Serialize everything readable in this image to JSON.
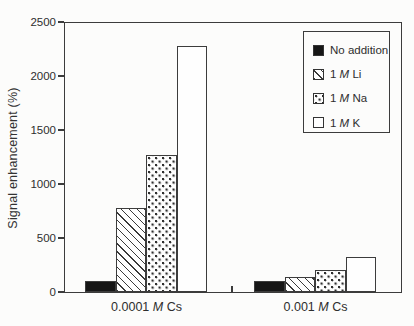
{
  "figure": {
    "background": "#fcfcfb",
    "line_color": "#3c3c3c",
    "text_color": "#2e2e2e",
    "bar_fill_black": "#161616"
  },
  "chart_data": {
    "type": "bar",
    "title": "",
    "xlabel": "",
    "ylabel": "Signal enhancement (%)",
    "ylim": [
      0,
      2500
    ],
    "yticks": [
      "0",
      "500",
      "1000",
      "1500",
      "2000",
      "2500"
    ],
    "ytick_values": [
      0,
      500,
      1000,
      1500,
      2000,
      2500
    ],
    "grid": false,
    "legend_position": "top-right",
    "categories": [
      {
        "label": "0.0001 M Cs",
        "parts": {
          "prefix": "0.0001 ",
          "italic": "M",
          "suffix": " Cs"
        }
      },
      {
        "label": "0.001 M Cs",
        "parts": {
          "prefix": "0.001 ",
          "italic": "M",
          "suffix": " Cs"
        }
      }
    ],
    "series": [
      {
        "name": "No addition",
        "parts": {
          "prefix": "No addition",
          "italic": "",
          "suffix": ""
        },
        "pattern": "solid-black",
        "values": [
          100,
          100
        ]
      },
      {
        "name": "1 M Li",
        "parts": {
          "prefix": "1 ",
          "italic": "M",
          "suffix": " Li"
        },
        "pattern": "diagonal-hatch",
        "values": [
          780,
          140
        ]
      },
      {
        "name": "1 M Na",
        "parts": {
          "prefix": "1 ",
          "italic": "M",
          "suffix": " Na"
        },
        "pattern": "dotted",
        "values": [
          1270,
          200
        ]
      },
      {
        "name": "1 M K",
        "parts": {
          "prefix": "1 ",
          "italic": "M",
          "suffix": " K"
        },
        "pattern": "open-white",
        "values": [
          2280,
          320
        ]
      }
    ]
  }
}
